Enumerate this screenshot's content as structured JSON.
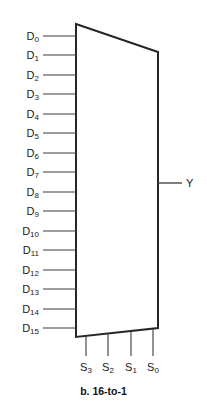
{
  "figure": {
    "caption": "b. 16-to-1",
    "type": "logic-symbol",
    "component": "multiplexer",
    "colors": {
      "background": "#ffffff",
      "outline": "#262626",
      "wire": "#3a3a3a",
      "text": "#1a1a1a"
    },
    "body": {
      "shape": "trapezoid",
      "top_left": [
        76,
        24
      ],
      "top_right": [
        158,
        52
      ],
      "bottom_right": [
        158,
        328
      ],
      "bottom_left": [
        76,
        337
      ]
    }
  },
  "data_inputs": {
    "count": 16,
    "labels": [
      {
        "base": "D",
        "sub": "0",
        "y": 36
      },
      {
        "base": "D",
        "sub": "1",
        "y": 55
      },
      {
        "base": "D",
        "sub": "2",
        "y": 75
      },
      {
        "base": "D",
        "sub": "3",
        "y": 94
      },
      {
        "base": "D",
        "sub": "4",
        "y": 114
      },
      {
        "base": "D",
        "sub": "5",
        "y": 133
      },
      {
        "base": "D",
        "sub": "6",
        "y": 153
      },
      {
        "base": "D",
        "sub": "7",
        "y": 172
      },
      {
        "base": "D",
        "sub": "8",
        "y": 192
      },
      {
        "base": "D",
        "sub": "9",
        "y": 211
      },
      {
        "base": "D",
        "sub": "10",
        "y": 231
      },
      {
        "base": "D",
        "sub": "11",
        "y": 250
      },
      {
        "base": "D",
        "sub": "12",
        "y": 270
      },
      {
        "base": "D",
        "sub": "13",
        "y": 289
      },
      {
        "base": "D",
        "sub": "14",
        "y": 309
      },
      {
        "base": "D",
        "sub": "15",
        "y": 328
      }
    ],
    "wire_x_start": 43,
    "wire_x_end": 76,
    "label_right_edge": 39
  },
  "select_inputs": {
    "count": 4,
    "labels": [
      {
        "base": "S",
        "sub": "3",
        "x": 86,
        "top_y": 336,
        "bottom_y": 356
      },
      {
        "base": "S",
        "sub": "2",
        "x": 108,
        "top_y": 334,
        "bottom_y": 356
      },
      {
        "base": "S",
        "sub": "1",
        "x": 131,
        "top_y": 331,
        "bottom_y": 356
      },
      {
        "base": "S",
        "sub": "0",
        "x": 153,
        "top_y": 329,
        "bottom_y": 356
      }
    ],
    "label_y": 368
  },
  "output": {
    "label": "Y",
    "wire_x_start": 158,
    "wire_x_end": 182,
    "wire_y": 183,
    "label_x": 186,
    "label_y": 183
  },
  "caption_position": {
    "y": 385
  }
}
